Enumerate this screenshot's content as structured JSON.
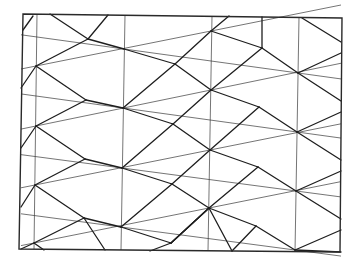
{
  "diagram": {
    "title": "",
    "type": "triangulated-lattice-tiling",
    "colors": {
      "background": "#ffffff",
      "line": "#1e1e1e",
      "thin_line": "#3a3a3a"
    },
    "frame": [
      [
        23,
        14
      ],
      [
        342,
        18
      ],
      [
        340,
        252
      ],
      [
        19,
        249
      ]
    ],
    "verticals": [
      [
        [
          37,
          14
        ],
        [
          34,
          249
        ]
      ],
      [
        [
          125,
          15
        ],
        [
          121,
          250
        ]
      ],
      [
        [
          212,
          16
        ],
        [
          208,
          251
        ]
      ],
      [
        [
          299,
          17
        ],
        [
          295,
          252
        ]
      ]
    ],
    "hubs": {
      "A": [
        [
          36,
          66
        ],
        [
          36,
          126
        ],
        [
          35,
          185
        ],
        [
          34,
          243
        ]
      ],
      "B": [
        [
          124,
          49
        ],
        [
          123,
          108
        ],
        [
          122,
          168
        ],
        [
          121,
          227
        ]
      ],
      "C": [
        [
          211,
          31
        ],
        [
          211,
          90
        ],
        [
          210,
          150
        ],
        [
          209,
          208
        ]
      ],
      "D": [
        [
          298,
          73
        ],
        [
          297,
          132
        ],
        [
          296,
          191
        ],
        [
          295,
          250
        ]
      ]
    },
    "mids": {
      "AB": [
        [
          88,
          39
        ],
        [
          86,
          100
        ],
        [
          85,
          159
        ],
        [
          84,
          218
        ]
      ],
      "BC": [
        [
          175,
          64
        ],
        [
          173,
          124
        ],
        [
          172,
          184
        ],
        [
          171,
          243
        ]
      ],
      "CD": [
        [
          262,
          48
        ],
        [
          259,
          107
        ],
        [
          258,
          167
        ],
        [
          256,
          226
        ]
      ]
    }
  }
}
